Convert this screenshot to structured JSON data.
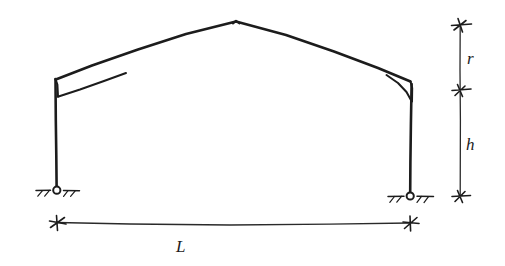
{
  "figure": {
    "name": "gable-portal-frame-diagram",
    "background_color": "#ffffff",
    "ink_color": "#1c1c1c"
  },
  "labels": {
    "span": "L",
    "column_height": "h",
    "rafter_rise": "r"
  },
  "geometry": {
    "left_column_x": 56,
    "right_column_x": 410,
    "base_y": 190,
    "right_base_y": 196,
    "eaves_left_y": 78,
    "eaves_right_y": 85,
    "apex_x": 236,
    "apex_y": 22,
    "dimension_line_x": 460,
    "dimension_top_y": 25,
    "dimension_mid_y": 90,
    "dimension_bottom_y": 196,
    "span_line_y": 223
  },
  "supports": {
    "left": {
      "type": "pinned-support",
      "hatching": "ground-hatch"
    },
    "right": {
      "type": "pinned-support",
      "hatching": "ground-hatch"
    }
  }
}
